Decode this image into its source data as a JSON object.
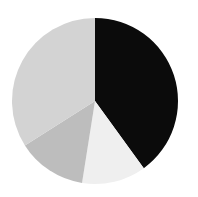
{
  "chart_data": {
    "type": "pie",
    "title": "",
    "start": "top",
    "direction": "clockwise",
    "legend": "none",
    "slices": [
      {
        "label": "",
        "value": 40.0,
        "color": "#0b0b0b"
      },
      {
        "label": "",
        "value": 12.5,
        "color": "#efefef"
      },
      {
        "label": "",
        "value": 13.5,
        "color": "#bdbdbd"
      },
      {
        "label": "",
        "value": 34.0,
        "color": "#d3d3d3"
      }
    ]
  }
}
